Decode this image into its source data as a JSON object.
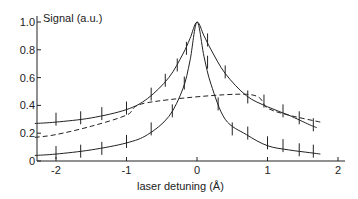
{
  "chart_data": {
    "type": "line",
    "title": "",
    "ylabel": "Signal (a.u.)",
    "xlabel": "laser detuning (Å)",
    "xlim": [
      -2.3,
      2.1
    ],
    "ylim": [
      0,
      1.05
    ],
    "x_ticks": [
      -2,
      -1,
      0,
      1,
      2
    ],
    "x_tick_labels": [
      "-2",
      "-1",
      "0",
      "1",
      "2"
    ],
    "y_ticks": [
      0,
      0.2,
      0.4,
      0.6,
      0.8,
      1.0
    ],
    "y_tick_labels": [
      "0",
      "0.2",
      "0.4",
      "0.6",
      "0.8",
      "1.0"
    ],
    "grid": false,
    "legend": null,
    "series": [
      {
        "name": "upper (solid)",
        "style": "solid",
        "x": [
          -2.3,
          -2.0,
          -1.5,
          -1.0,
          -0.7,
          -0.4,
          -0.2,
          -0.1,
          0.0,
          0.1,
          0.2,
          0.4,
          0.7,
          1.0,
          1.3,
          1.6,
          1.7
        ],
        "y": [
          0.27,
          0.28,
          0.31,
          0.37,
          0.45,
          0.6,
          0.77,
          0.88,
          1.0,
          0.9,
          0.8,
          0.63,
          0.47,
          0.39,
          0.33,
          0.26,
          0.24
        ]
      },
      {
        "name": "dashed",
        "style": "dashed",
        "x": [
          -2.3,
          -2.0,
          -1.5,
          -1.0,
          -0.7,
          0.7,
          1.0,
          1.3,
          1.75
        ],
        "y": [
          0.17,
          0.19,
          0.25,
          0.33,
          0.42,
          0.48,
          0.38,
          0.33,
          0.28
        ]
      },
      {
        "name": "lower (solid)",
        "style": "solid",
        "x": [
          -2.3,
          -2.0,
          -1.5,
          -1.0,
          -0.7,
          -0.4,
          -0.2,
          -0.1,
          0.0,
          0.1,
          0.2,
          0.4,
          0.7,
          1.0,
          1.3,
          1.6,
          1.75
        ],
        "y": [
          0.04,
          0.05,
          0.08,
          0.13,
          0.19,
          0.32,
          0.52,
          0.72,
          1.0,
          0.75,
          0.55,
          0.3,
          0.19,
          0.11,
          0.08,
          0.06,
          0.05
        ]
      }
    ],
    "error_bars": {
      "upper": [
        [
          -2.0,
          0.29
        ],
        [
          -1.65,
          0.3
        ],
        [
          -1.35,
          0.33
        ],
        [
          -1.0,
          0.37
        ],
        [
          -0.65,
          0.47
        ],
        [
          -0.45,
          0.57
        ],
        [
          -0.28,
          0.68
        ],
        [
          -0.15,
          0.8
        ],
        [
          0.15,
          0.86
        ],
        [
          0.4,
          0.63
        ],
        [
          0.72,
          0.45
        ],
        [
          0.95,
          0.42
        ],
        [
          1.22,
          0.35
        ],
        [
          1.45,
          0.3
        ],
        [
          1.65,
          0.25
        ]
      ],
      "lower": [
        [
          -2.0,
          0.05
        ],
        [
          -1.65,
          0.06
        ],
        [
          -1.35,
          0.08
        ],
        [
          -1.0,
          0.13
        ],
        [
          -0.65,
          0.22
        ],
        [
          -0.35,
          0.35
        ],
        [
          -0.18,
          0.55
        ],
        [
          0.15,
          0.7
        ],
        [
          0.3,
          0.4
        ],
        [
          0.5,
          0.22
        ],
        [
          0.72,
          0.19
        ],
        [
          1.0,
          0.12
        ],
        [
          1.22,
          0.1
        ],
        [
          1.45,
          0.07
        ],
        [
          1.65,
          0.06
        ]
      ]
    }
  }
}
